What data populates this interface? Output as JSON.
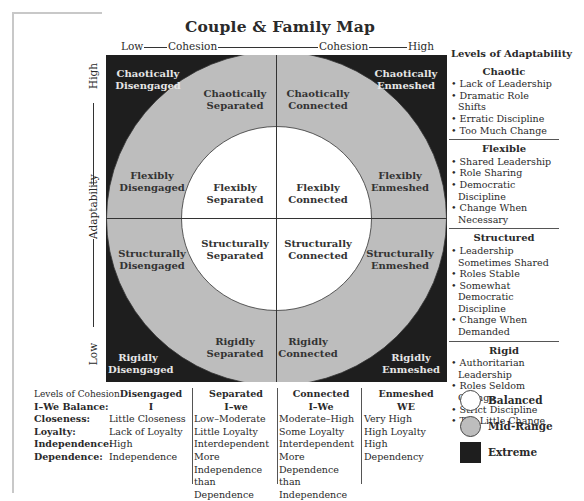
{
  "title": "Couple & Family Map",
  "cohesion_axis": {
    "low": "Low",
    "label_left": "Cohesion",
    "label_right": "Cohesion",
    "high": "High"
  },
  "adaptability_axis": {
    "low": "Low",
    "label": "Adaptability",
    "high": "High"
  },
  "colors": {
    "extreme": "#1e1e1e",
    "mid_range": "#bdbdbd",
    "balanced": "#ffffff"
  },
  "cells": {
    "chaotically_disengaged": "Chaotically Disengaged",
    "chaotically_separated": "Chaotically Separated",
    "chaotically_connected": "Chaotically Connected",
    "chaotically_enmeshed": "Chaotically Enmeshed",
    "flexibly_disengaged": "Flexibly Disengaged",
    "flexibly_separated": "Flexibly Separated",
    "flexibly_connected": "Flexibly Connected",
    "flexibly_enmeshed": "Flexibly Enmeshed",
    "structurally_disengaged": "Structurally Disengaged",
    "structurally_separated": "Structurally Separated",
    "structurally_connected": "Structurally Connected",
    "structurally_enmeshed": "Structurally Enmeshed",
    "rigidly_disengaged": "Rigidly Disengaged",
    "rigidly_separated": "Rigidly Separated",
    "rigidly_connected": "Rigidly Connected",
    "rigidly_enmeshed": "Rigidly Enmeshed"
  },
  "adaptability": {
    "heading": "Levels of Adaptability",
    "groups": [
      {
        "title": "Chaotic",
        "items": [
          "Lack of Leadership",
          "Dramatic Role Shifts",
          "Erratic Discipline",
          "Too Much Change"
        ]
      },
      {
        "title": "Flexible",
        "items": [
          "Shared Leadership",
          "Role Sharing",
          "Democratic Discipline",
          "Change When Necessary"
        ]
      },
      {
        "title": "Structured",
        "items": [
          "Leadership Sometimes Shared",
          "Roles Stable",
          "Somewhat Democratic Discipline",
          "Change When Demanded"
        ]
      },
      {
        "title": "Rigid",
        "items": [
          "Authoritarian Leadership",
          "Roles Seldom Change",
          "Strict Discipline",
          "Too Little Change"
        ]
      }
    ]
  },
  "cohesion": {
    "row_labels": [
      "Levels of Cohesion",
      "I–We Balance:",
      "Closeness:",
      "Loyalty:",
      "Independence:",
      "Dependence:"
    ],
    "columns": [
      {
        "name": "Disengaged",
        "balance": "I",
        "closeness": "Little Closeness",
        "loyalty": "Lack of Loyalty",
        "independence": "High Independence",
        "dependence": ""
      },
      {
        "name": "Separated",
        "balance": "I–we",
        "closeness": "Low–Moderate",
        "loyalty": "Little Loyalty",
        "independence": "Interdependent",
        "dependence": "More Independence than Dependence"
      },
      {
        "name": "Connected",
        "balance": "I–We",
        "closeness": "Moderate–High",
        "loyalty": "Some Loyalty",
        "independence": "Interdependent",
        "dependence": "More Dependence than Independence"
      },
      {
        "name": "Enmeshed",
        "balance": "WE",
        "closeness": "Very High",
        "loyalty": "High Loyalty",
        "independence": "High Dependency",
        "dependence": ""
      }
    ]
  },
  "legend": [
    {
      "label": "Balanced",
      "shape": "circle",
      "color": "#ffffff"
    },
    {
      "label": "Mid-Range",
      "shape": "circle",
      "color": "#bdbdbd"
    },
    {
      "label": "Extreme",
      "shape": "square",
      "color": "#1e1e1e"
    }
  ]
}
